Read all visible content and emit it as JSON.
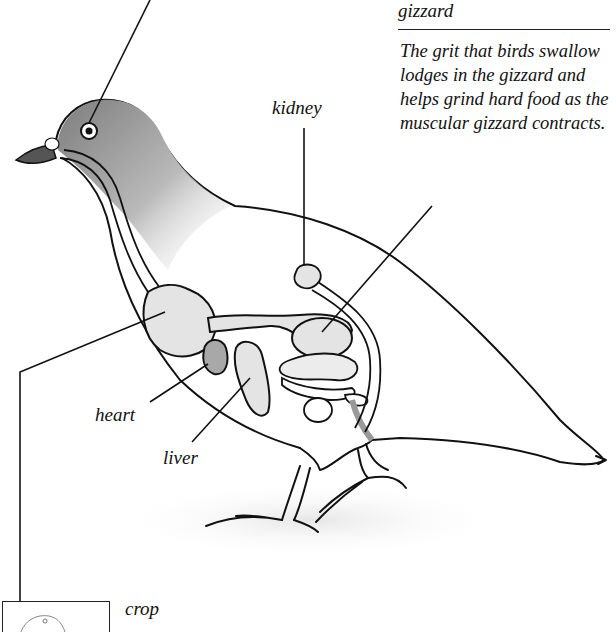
{
  "diagram": {
    "colors": {
      "ink": "#111111",
      "organ_fill": "#e4e4e4",
      "heart_fill": "#a8a8a8",
      "head_shade": "#8a8a8a"
    }
  },
  "callout": {
    "heading": "gizzard",
    "description": "The grit that birds swallow lodges in the gizzard and helps grind hard food as the muscular gizzard contracts."
  },
  "labels": {
    "kidney": "kidney",
    "heart": "heart",
    "liver": "liver",
    "crop": "crop"
  }
}
